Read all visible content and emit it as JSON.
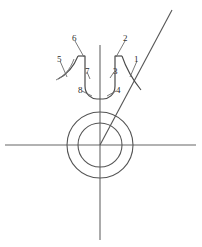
{
  "figure": {
    "type": "technical-line-drawing",
    "title": "",
    "background_color": "#ffffff",
    "stroke_color": "#555555",
    "label_color": "#2b2b2b",
    "canvas": {
      "width": 202,
      "height": 247
    }
  },
  "axes": {
    "horizontal": {
      "name": "horizontal-axis-line",
      "x1": 5,
      "y1": 145,
      "x2": 196,
      "y2": 145
    },
    "vertical": {
      "name": "vertical-axis-line",
      "x1": 100,
      "y1": 45,
      "x2": 100,
      "y2": 240
    }
  },
  "circles": [
    {
      "name": "outer-circle",
      "cx": 100,
      "cy": 145,
      "r": 33
    },
    {
      "name": "inner-circle",
      "cx": 100,
      "cy": 145,
      "r": 22
    }
  ],
  "diagonal": {
    "name": "diagonal-ray",
    "x1": 100,
    "y1": 145,
    "x2": 172,
    "y2": 10
  },
  "slot": {
    "name": "u-shaped-slot",
    "description": "U shaped channel straddling the vertical axis",
    "left_wall_x": 85,
    "right_wall_x": 115,
    "top_y": 56,
    "bottom_y": 96
  },
  "wings": {
    "left_arc": {
      "name": "left-flank-arc"
    },
    "right_arc": {
      "name": "right-flank-arc"
    }
  },
  "callouts": [
    {
      "id": "1",
      "label": "1",
      "x": 134,
      "y": 55,
      "name": "callout-1"
    },
    {
      "id": "2",
      "label": "2",
      "x": 123,
      "y": 34,
      "name": "callout-2"
    },
    {
      "id": "3",
      "label": "3",
      "x": 113,
      "y": 67,
      "name": "callout-3"
    },
    {
      "id": "4",
      "label": "4",
      "x": 116,
      "y": 86,
      "name": "callout-4"
    },
    {
      "id": "5",
      "label": "5",
      "x": 57,
      "y": 55,
      "name": "callout-5"
    },
    {
      "id": "6",
      "label": "6",
      "x": 72,
      "y": 34,
      "name": "callout-6"
    },
    {
      "id": "7",
      "label": "7",
      "x": 85,
      "y": 67,
      "name": "callout-7"
    },
    {
      "id": "8",
      "label": "8",
      "x": 78,
      "y": 86,
      "name": "callout-8"
    }
  ],
  "leaders": [
    {
      "id": "1",
      "name": "leader-line-1",
      "points": "137,61 130,77"
    },
    {
      "id": "2",
      "name": "leader-line-2",
      "points": "125,41 116,57"
    },
    {
      "id": "3",
      "name": "leader-line-3",
      "points": "114,72 110,78"
    },
    {
      "id": "4",
      "name": "leader-line-4",
      "points": "116,91 107,96"
    },
    {
      "id": "5",
      "name": "leader-line-5",
      "points": "60,61 67,77"
    },
    {
      "id": "6",
      "name": "leader-line-6",
      "points": "75,41 84,57"
    },
    {
      "id": "7",
      "name": "leader-line-7",
      "points": "87,72 90,79"
    },
    {
      "id": "8",
      "name": "leader-line-8",
      "points": "82,91 92,96"
    }
  ]
}
